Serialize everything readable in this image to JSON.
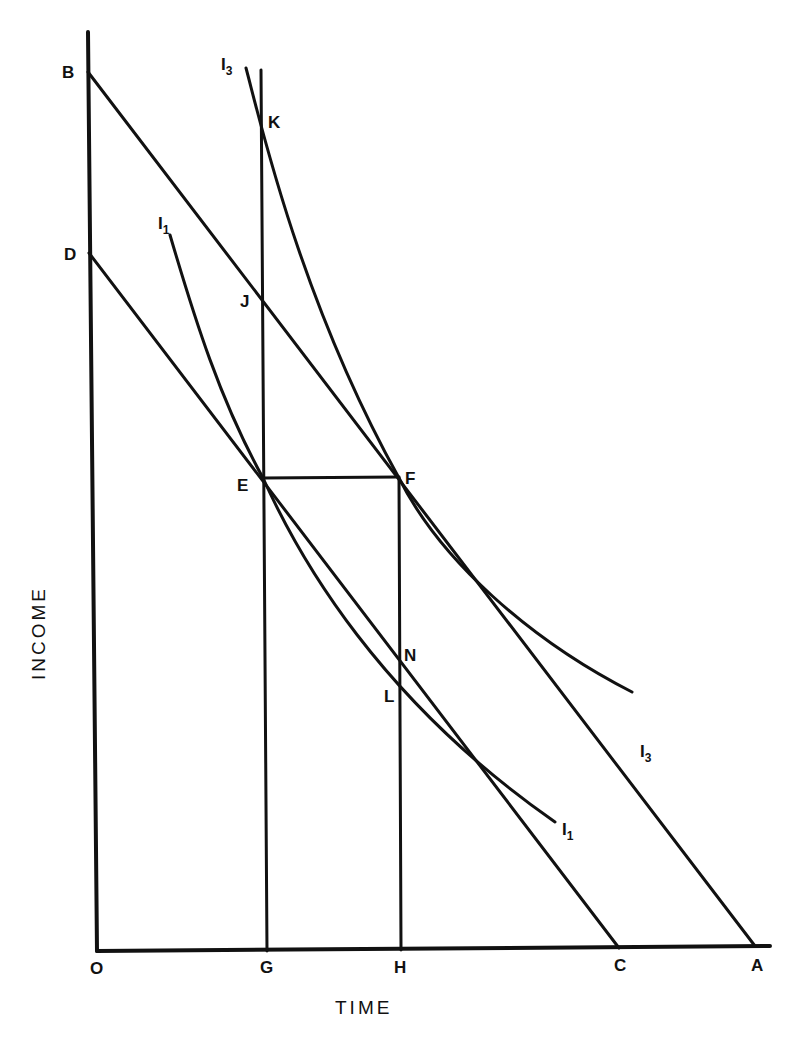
{
  "diagram": {
    "axes": {
      "x_title": "TIME",
      "y_title": "INCOME",
      "origin_label": "O"
    },
    "points": {
      "B": "B",
      "D": "D",
      "K": "K",
      "J": "J",
      "E": "E",
      "F": "F",
      "N": "N",
      "L": "L",
      "G": "G",
      "H": "H",
      "C": "C",
      "A": "A"
    },
    "curves": {
      "i3_top": {
        "base": "I",
        "sub": "3"
      },
      "i3_bottom": {
        "base": "I",
        "sub": "3"
      },
      "i1_top": {
        "base": "I",
        "sub": "1"
      },
      "i1_bottom": {
        "base": "I",
        "sub": "1"
      }
    },
    "lines": [
      {
        "name": "budget-line-BA",
        "from": "B",
        "to": "A"
      },
      {
        "name": "budget-line-DC",
        "from": "D",
        "to": "C"
      },
      {
        "name": "vertical-GK",
        "from": "G",
        "to": "K"
      },
      {
        "name": "vertical-HF",
        "from": "H",
        "to": "F"
      },
      {
        "name": "horizontal-EF",
        "from": "E",
        "to": "F"
      }
    ],
    "colors": {
      "ink": "#111111",
      "paper": "#ffffff"
    }
  }
}
